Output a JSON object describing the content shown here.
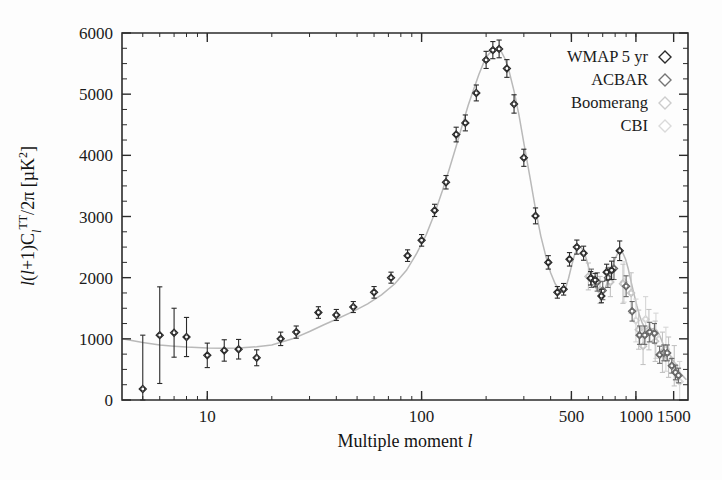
{
  "figure": {
    "title": "",
    "background": "#fdfdfd"
  },
  "chart_data": {
    "type": "scatter",
    "title": "",
    "xlabel": "Multiple moment l",
    "ylabel": "l(l+1)C_l^TT/2π [μK²]",
    "ylabel_parts": {
      "pre": "l(l+1)C",
      "sub": "l",
      "sup": "TT",
      "post": "/2π [μK",
      "post_sup": "2",
      "tail": "]"
    },
    "xscale": "log",
    "yscale": "linear",
    "xlim": [
      4,
      1750
    ],
    "ylim": [
      0,
      6000
    ],
    "grid": false,
    "xticks": [
      10,
      100,
      500,
      1000,
      1500
    ],
    "xticklabels": [
      "10",
      "100",
      "500",
      "1000",
      "1500"
    ],
    "yticks": [
      0,
      1000,
      2000,
      3000,
      4000,
      5000,
      6000
    ],
    "yticklabels": [
      "0",
      "1000",
      "2000",
      "3000",
      "4000",
      "5000",
      "6000"
    ],
    "yminor_step": 250,
    "legend_position": "top-right",
    "series": [
      {
        "name": "WMAP 5 yr",
        "marker": "diamond",
        "color": "#2a2a2a",
        "points": [
          {
            "x": 5,
            "y": 180,
            "err": 880
          },
          {
            "x": 6,
            "y": 1060,
            "err": 790
          },
          {
            "x": 7,
            "y": 1100,
            "err": 400
          },
          {
            "x": 8,
            "y": 1030,
            "err": 320
          },
          {
            "x": 10,
            "y": 730,
            "err": 200
          },
          {
            "x": 12,
            "y": 810,
            "err": 175
          },
          {
            "x": 14,
            "y": 830,
            "err": 160
          },
          {
            "x": 17,
            "y": 690,
            "err": 130
          },
          {
            "x": 22,
            "y": 1000,
            "err": 110
          },
          {
            "x": 26,
            "y": 1110,
            "err": 100
          },
          {
            "x": 33,
            "y": 1430,
            "err": 95
          },
          {
            "x": 40,
            "y": 1390,
            "err": 90
          },
          {
            "x": 48,
            "y": 1520,
            "err": 90
          },
          {
            "x": 60,
            "y": 1760,
            "err": 95
          },
          {
            "x": 72,
            "y": 2000,
            "err": 90
          },
          {
            "x": 86,
            "y": 2360,
            "err": 95
          },
          {
            "x": 100,
            "y": 2610,
            "err": 95
          },
          {
            "x": 115,
            "y": 3100,
            "err": 100
          },
          {
            "x": 130,
            "y": 3560,
            "err": 110
          },
          {
            "x": 145,
            "y": 4340,
            "err": 120
          },
          {
            "x": 160,
            "y": 4530,
            "err": 130
          },
          {
            "x": 180,
            "y": 5020,
            "err": 130
          },
          {
            "x": 200,
            "y": 5560,
            "err": 140
          },
          {
            "x": 215,
            "y": 5720,
            "err": 140
          },
          {
            "x": 230,
            "y": 5740,
            "err": 145
          },
          {
            "x": 250,
            "y": 5420,
            "err": 145
          },
          {
            "x": 270,
            "y": 4840,
            "err": 150
          },
          {
            "x": 300,
            "y": 3960,
            "err": 140
          },
          {
            "x": 340,
            "y": 3010,
            "err": 130
          },
          {
            "x": 390,
            "y": 2250,
            "err": 110
          },
          {
            "x": 430,
            "y": 1760,
            "err": 95
          },
          {
            "x": 460,
            "y": 1810,
            "err": 95
          },
          {
            "x": 490,
            "y": 2300,
            "err": 110
          },
          {
            "x": 530,
            "y": 2500,
            "err": 115
          },
          {
            "x": 570,
            "y": 2400,
            "err": 115
          },
          {
            "x": 615,
            "y": 1990,
            "err": 110
          },
          {
            "x": 645,
            "y": 1960,
            "err": 110
          },
          {
            "x": 690,
            "y": 1700,
            "err": 110
          },
          {
            "x": 730,
            "y": 2090,
            "err": 130
          },
          {
            "x": 770,
            "y": 2120,
            "err": 150
          },
          {
            "x": 840,
            "y": 2440,
            "err": 160
          }
        ]
      },
      {
        "name": "ACBAR",
        "marker": "diamond",
        "color": "#666666",
        "points": [
          {
            "x": 620,
            "y": 1990,
            "err": 150
          },
          {
            "x": 660,
            "y": 1930,
            "err": 150
          },
          {
            "x": 700,
            "y": 1790,
            "err": 150
          },
          {
            "x": 740,
            "y": 2000,
            "err": 160
          },
          {
            "x": 790,
            "y": 2150,
            "err": 180
          },
          {
            "x": 900,
            "y": 1860,
            "err": 170
          },
          {
            "x": 960,
            "y": 1450,
            "err": 160
          },
          {
            "x": 1040,
            "y": 1060,
            "err": 150
          },
          {
            "x": 1100,
            "y": 1060,
            "err": 150
          },
          {
            "x": 1160,
            "y": 1110,
            "err": 160
          },
          {
            "x": 1220,
            "y": 1090,
            "err": 160
          },
          {
            "x": 1290,
            "y": 740,
            "err": 140
          },
          {
            "x": 1350,
            "y": 770,
            "err": 130
          },
          {
            "x": 1400,
            "y": 770,
            "err": 130
          },
          {
            "x": 1470,
            "y": 560,
            "err": 120
          },
          {
            "x": 1530,
            "y": 450,
            "err": 120
          },
          {
            "x": 1580,
            "y": 400,
            "err": 120
          }
        ]
      },
      {
        "name": "Boomerang",
        "marker": "diamond",
        "color": "#c3c3c3",
        "points": [
          {
            "x": 600,
            "y": 2020,
            "err": 220
          },
          {
            "x": 680,
            "y": 1800,
            "err": 220
          },
          {
            "x": 760,
            "y": 1930,
            "err": 240
          },
          {
            "x": 870,
            "y": 1900,
            "err": 320
          },
          {
            "x": 950,
            "y": 1750,
            "err": 330
          },
          {
            "x": 1030,
            "y": 1150,
            "err": 320
          },
          {
            "x": 1080,
            "y": 880,
            "err": 300
          },
          {
            "x": 1150,
            "y": 1150,
            "err": 330
          },
          {
            "x": 1230,
            "y": 960,
            "err": 330
          },
          {
            "x": 1330,
            "y": 780,
            "err": 330
          },
          {
            "x": 1420,
            "y": 700,
            "err": 330
          },
          {
            "x": 1510,
            "y": 560,
            "err": 330
          }
        ]
      },
      {
        "name": "CBI",
        "marker": "diamond",
        "color": "#d6d6d6",
        "points": [
          {
            "x": 880,
            "y": 1930,
            "err": 330
          },
          {
            "x": 1000,
            "y": 1300,
            "err": 350
          },
          {
            "x": 1110,
            "y": 1320,
            "err": 370
          },
          {
            "x": 1240,
            "y": 1050,
            "err": 370
          },
          {
            "x": 1380,
            "y": 830,
            "err": 360
          },
          {
            "x": 1600,
            "y": 300,
            "err": 330
          }
        ]
      }
    ],
    "model": {
      "name": "best-fit LCDM",
      "color": "#b9b9b9",
      "points": [
        [
          4,
          1000
        ],
        [
          5,
          940
        ],
        [
          6,
          900
        ],
        [
          7,
          880
        ],
        [
          8,
          865
        ],
        [
          10,
          850
        ],
        [
          12,
          845
        ],
        [
          14,
          850
        ],
        [
          17,
          870
        ],
        [
          20,
          900
        ],
        [
          25,
          1000
        ],
        [
          30,
          1120
        ],
        [
          35,
          1230
        ],
        [
          40,
          1320
        ],
        [
          48,
          1450
        ],
        [
          56,
          1570
        ],
        [
          65,
          1720
        ],
        [
          75,
          1900
        ],
        [
          85,
          2120
        ],
        [
          95,
          2400
        ],
        [
          105,
          2700
        ],
        [
          115,
          3050
        ],
        [
          125,
          3420
        ],
        [
          135,
          3790
        ],
        [
          145,
          4150
        ],
        [
          155,
          4500
        ],
        [
          165,
          4820
        ],
        [
          175,
          5080
        ],
        [
          185,
          5320
        ],
        [
          195,
          5520
        ],
        [
          205,
          5650
        ],
        [
          215,
          5720
        ],
        [
          225,
          5740
        ],
        [
          235,
          5700
        ],
        [
          245,
          5580
        ],
        [
          255,
          5400
        ],
        [
          270,
          5050
        ],
        [
          285,
          4650
        ],
        [
          300,
          4200
        ],
        [
          320,
          3650
        ],
        [
          340,
          3120
        ],
        [
          360,
          2680
        ],
        [
          380,
          2350
        ],
        [
          400,
          2080
        ],
        [
          420,
          1900
        ],
        [
          440,
          1800
        ],
        [
          455,
          1770
        ],
        [
          470,
          1830
        ],
        [
          485,
          1990
        ],
        [
          500,
          2180
        ],
        [
          515,
          2350
        ],
        [
          530,
          2470
        ],
        [
          545,
          2510
        ],
        [
          560,
          2480
        ],
        [
          575,
          2400
        ],
        [
          590,
          2280
        ],
        [
          605,
          2140
        ],
        [
          620,
          2010
        ],
        [
          640,
          1880
        ],
        [
          660,
          1790
        ],
        [
          680,
          1730
        ],
        [
          700,
          1740
        ],
        [
          720,
          1830
        ],
        [
          745,
          1980
        ],
        [
          770,
          2140
        ],
        [
          795,
          2290
        ],
        [
          820,
          2390
        ],
        [
          845,
          2430
        ],
        [
          870,
          2400
        ],
        [
          895,
          2300
        ],
        [
          920,
          2150
        ],
        [
          950,
          1930
        ],
        [
          980,
          1730
        ],
        [
          1010,
          1540
        ],
        [
          1040,
          1380
        ],
        [
          1070,
          1260
        ],
        [
          1100,
          1180
        ],
        [
          1130,
          1140
        ],
        [
          1160,
          1140
        ],
        [
          1190,
          1160
        ],
        [
          1220,
          1170
        ],
        [
          1250,
          1140
        ],
        [
          1280,
          1080
        ],
        [
          1310,
          1000
        ],
        [
          1340,
          910
        ],
        [
          1380,
          820
        ],
        [
          1420,
          760
        ],
        [
          1460,
          700
        ],
        [
          1500,
          630
        ],
        [
          1540,
          560
        ],
        [
          1580,
          490
        ],
        [
          1620,
          430
        ],
        [
          1680,
          370
        ],
        [
          1720,
          330
        ]
      ]
    }
  },
  "legend": {
    "entries": [
      {
        "label": "WMAP 5 yr",
        "color": "#2a2a2a"
      },
      {
        "label": "ACBAR",
        "color": "#757575"
      },
      {
        "label": "Boomerang",
        "color": "#cccccc"
      },
      {
        "label": "CBI",
        "color": "#dadada"
      }
    ]
  }
}
